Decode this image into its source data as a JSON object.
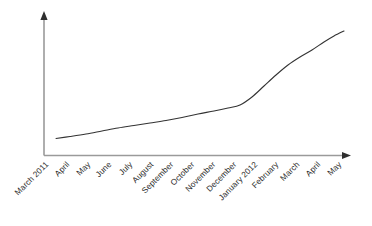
{
  "chart_data": {
    "type": "line",
    "title": "",
    "subtitle": "",
    "xlabel": "",
    "ylabel": "",
    "grid": false,
    "legend": false,
    "legend_position": "none",
    "axis_arrows": true,
    "y_tick_labels": [],
    "ylim": [
      0,
      100
    ],
    "categories": [
      "March 2011",
      "April",
      "May",
      "June",
      "July",
      "August",
      "September",
      "October",
      "November",
      "December",
      "January 2012",
      "February",
      "March",
      "April",
      "May"
    ],
    "series": [
      {
        "name": "trend",
        "color": "#333333",
        "values": [
          14,
          16,
          19,
          22,
          25,
          28,
          32,
          36,
          40,
          45,
          52,
          63,
          77,
          88,
          96
        ]
      }
    ],
    "annotations": []
  },
  "axes": {
    "color": "#9a9a9a",
    "x_axis_name": "x-axis",
    "y_axis_name": "y-axis"
  },
  "curve": {
    "color": "#333333",
    "stroke_width": 1.1,
    "points": [
      [
        56,
        138.5
      ],
      [
        70,
        136.5
      ],
      [
        86,
        134
      ],
      [
        102,
        131
      ],
      [
        118,
        128
      ],
      [
        134,
        125.5
      ],
      [
        150,
        123
      ],
      [
        166,
        120.5
      ],
      [
        182,
        117.5
      ],
      [
        198,
        114
      ],
      [
        214,
        111
      ],
      [
        228,
        108
      ],
      [
        240,
        105
      ],
      [
        252,
        97
      ],
      [
        264,
        86
      ],
      [
        276,
        75
      ],
      [
        288,
        65
      ],
      [
        300,
        57
      ],
      [
        312,
        50
      ],
      [
        324,
        42
      ],
      [
        334,
        36
      ],
      [
        344,
        31
      ]
    ]
  },
  "tick_layout": {
    "first_x": 44,
    "step": 20.9,
    "baseline_y": 160,
    "rotation_deg": -45
  }
}
